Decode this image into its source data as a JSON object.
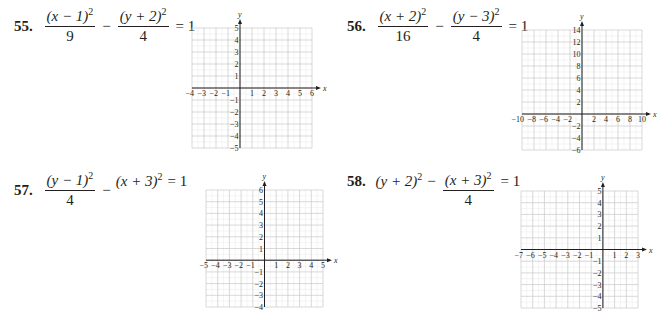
{
  "problems": [
    {
      "number": "55.",
      "equation_text": "(x − 1)^2/9 − (y + 2)^2/4 = 1",
      "parts": {
        "t1_num_base": "(x − 1)",
        "t1_num_exp": "2",
        "t1_den": "9",
        "op": "−",
        "t2_num_base": "(y + 2)",
        "t2_num_exp": "2",
        "t2_den": "4",
        "rhs": "= 1"
      }
    },
    {
      "number": "56.",
      "equation_text": "(x + 2)^2/16 − (y − 3)^2/4 = 1",
      "parts": {
        "t1_num_base": "(x + 2)",
        "t1_num_exp": "2",
        "t1_den": "16",
        "op": "−",
        "t2_num_base": "(y − 3)",
        "t2_num_exp": "2",
        "t2_den": "4",
        "rhs": "= 1"
      }
    },
    {
      "number": "57.",
      "equation_text": "(y − 1)^2/4 − (x + 3)^2 = 1",
      "parts": {
        "t1_num_base": "(y − 1)",
        "t1_num_exp": "2",
        "t1_den": "4",
        "op": "−",
        "t2_base": "(x + 3)",
        "t2_exp": "2",
        "rhs": "= 1"
      }
    },
    {
      "number": "58.",
      "equation_text": "(y + 2)^2 − (x + 3)^2/4 = 1",
      "parts": {
        "t1_base": "(y + 2)",
        "t1_exp": "2",
        "op": "−",
        "t2_num_base": "(x + 3)",
        "t2_num_exp": "2",
        "t2_den": "4",
        "rhs": "= 1"
      }
    }
  ],
  "chart_data": [
    {
      "type": "grid",
      "title": "55",
      "xlabel": "x",
      "ylabel": "y",
      "xlim": [
        -4,
        6
      ],
      "ylim": [
        -5,
        5
      ],
      "x_step": 1,
      "y_step": 1,
      "x_ticks": [
        -4,
        -3,
        -2,
        -1,
        1,
        2,
        3,
        4,
        5,
        6
      ],
      "y_ticks": [
        5,
        4,
        3,
        2,
        1,
        -1,
        -2,
        -3,
        -4,
        -5
      ],
      "grid": true,
      "minor_grid": true
    },
    {
      "type": "grid",
      "title": "56",
      "xlabel": "x",
      "ylabel": "y",
      "xlim": [
        -10,
        10
      ],
      "ylim": [
        -6,
        14
      ],
      "x_step": 2,
      "y_step": 2,
      "x_ticks": [
        -10,
        -8,
        -6,
        -4,
        -2,
        2,
        4,
        6,
        8,
        10
      ],
      "y_ticks": [
        14,
        12,
        10,
        8,
        6,
        4,
        2,
        -2,
        -4,
        -6
      ],
      "grid": true,
      "minor_grid": true
    },
    {
      "type": "grid",
      "title": "57",
      "xlabel": "x",
      "ylabel": "y",
      "xlim": [
        -5,
        5
      ],
      "ylim": [
        -4,
        6
      ],
      "x_step": 1,
      "y_step": 1,
      "x_ticks": [
        -5,
        -4,
        -3,
        -2,
        -1,
        1,
        2,
        3,
        4,
        5
      ],
      "y_ticks": [
        6,
        5,
        4,
        3,
        2,
        1,
        -1,
        -2,
        -3,
        -4
      ],
      "grid": true,
      "minor_grid": true
    },
    {
      "type": "grid",
      "title": "58",
      "xlabel": "x",
      "ylabel": "y",
      "xlim": [
        -7,
        3
      ],
      "ylim": [
        -5,
        5
      ],
      "x_step": 1,
      "y_step": 1,
      "x_ticks": [
        -7,
        -6,
        -5,
        -4,
        -3,
        -2,
        -1,
        1,
        2,
        3
      ],
      "y_ticks": [
        5,
        4,
        3,
        2,
        1,
        -1,
        -2,
        -3,
        -4,
        -5
      ],
      "grid": true,
      "minor_grid": true
    }
  ],
  "layout": {
    "graphs": [
      {
        "left": 192,
        "top": 28,
        "width": 120,
        "height": 120
      },
      {
        "left": 522,
        "top": 30,
        "width": 120,
        "height": 120
      },
      {
        "left": 206,
        "top": 190,
        "width": 117,
        "height": 117
      },
      {
        "left": 521,
        "top": 191,
        "width": 117,
        "height": 117
      }
    ]
  },
  "colors": {
    "text": "#231f20",
    "axis": "#231f20",
    "major_grid": "#c8c8c8",
    "minor_grid": "#ececec"
  }
}
